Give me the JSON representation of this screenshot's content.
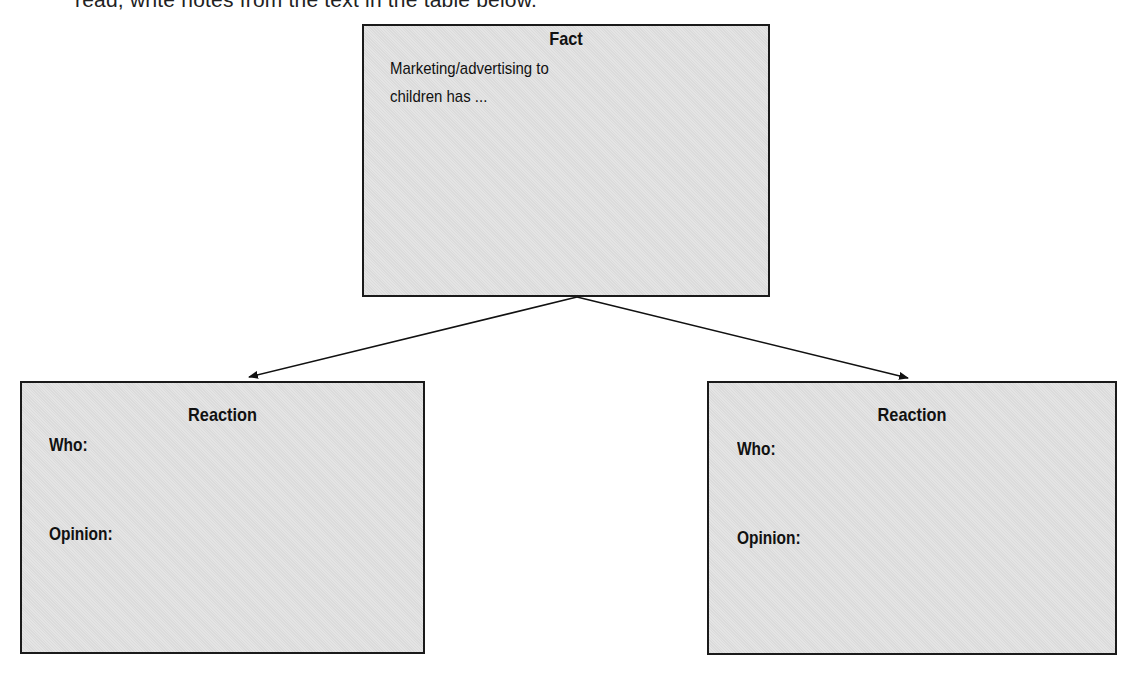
{
  "header": {
    "instruction_partial": "read, write notes from the text in the table below."
  },
  "diagram": {
    "fact_box": {
      "title": "Fact",
      "text_line1": "Marketing/advertising to",
      "text_line2": "children has ..."
    },
    "reaction_boxes": [
      {
        "title": "Reaction",
        "who_label": "Who:",
        "opinion_label": "Opinion:"
      },
      {
        "title": "Reaction",
        "who_label": "Who:",
        "opinion_label": "Opinion:"
      }
    ],
    "connections": [
      {
        "from": "Fact",
        "to": "Reaction (left)"
      },
      {
        "from": "Fact",
        "to": "Reaction (right)"
      }
    ],
    "colors": {
      "box_fill": "#e2e2e2",
      "box_border": "#1a1a1a",
      "arrow": "#111111"
    }
  }
}
